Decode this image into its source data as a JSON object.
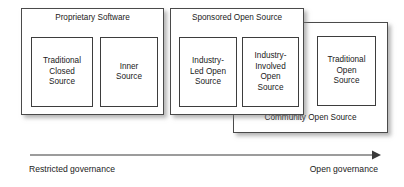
{
  "diagram": {
    "groups": [
      {
        "id": "proprietary",
        "title": "Proprietary Software",
        "items": [
          {
            "id": "traditional-closed-source",
            "label": "Traditional\nClosed\nSource"
          },
          {
            "id": "inner-source",
            "label": "Inner\nSource"
          }
        ]
      },
      {
        "id": "sponsored",
        "title": "Sponsored Open Source",
        "items": [
          {
            "id": "industry-led-open-source",
            "label": "Industry-\nLed Open\nSource"
          },
          {
            "id": "industry-involved-open-source",
            "label": "Industry-\nInvolved\nOpen\nSource"
          }
        ]
      },
      {
        "id": "community",
        "title": "Community Open Source",
        "items": [
          {
            "id": "traditional-open-source",
            "label": "Traditional\nOpen\nSource"
          }
        ]
      }
    ],
    "axis": {
      "left_label": "Restricted governance",
      "right_label": "Open governance",
      "direction": "left-to-right",
      "stroke_color": "#3a3a3a"
    },
    "colors": {
      "background": "#ffffff",
      "box_fill": "#ffffff",
      "box_border": "#4a4a4a",
      "text": "#1a1a1a",
      "shadow": "#787878"
    }
  }
}
